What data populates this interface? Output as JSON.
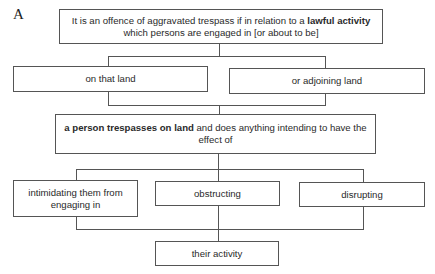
{
  "figure_label": "A",
  "boxes": {
    "top": {
      "text_pre": "It is an offence of aggravated trespass if in relation to a ",
      "text_bold": "lawful activity",
      "text_post": " which persons are engaged in [or about to be]"
    },
    "on_that_land": {
      "text": "on that land"
    },
    "adjoining_land": {
      "text": "or adjoining land"
    },
    "middle": {
      "text_bold": "a person trespasses on land",
      "text_post": " and does anything intending to have the effect of"
    },
    "intimidating": {
      "text": "intimidating them from engaging in"
    },
    "obstructing": {
      "text": "obstructing"
    },
    "disrupting": {
      "text": "disrupting"
    },
    "their_activity": {
      "text": "their activity"
    }
  },
  "colors": {
    "line": "#555555",
    "text": "#2a2a2a",
    "background": "#ffffff"
  }
}
